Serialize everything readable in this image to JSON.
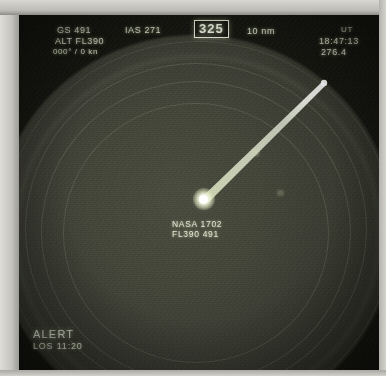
{
  "display": {
    "kind": "air-traffic-radar-scope",
    "colors": {
      "phosphor": "#d6dcc8",
      "screen_background": "#14150f",
      "disc": "#45473b",
      "highlight": "#ffffff",
      "bezel": "#c9c9c4"
    }
  },
  "header": {
    "ground_speed": "GS 491",
    "indicated_airspeed": "IAS 271",
    "heading_selected": "325",
    "range": "10 nm",
    "utc_label": "UT",
    "utc_time": "18:47:13",
    "baro": "276.4",
    "baro_unit": "mb"
  },
  "left_readout": {
    "altitude": "ALT FL390",
    "wind": "000° / 0 kn"
  },
  "target": {
    "callsign": "NASA 1702",
    "altitude_speed": "FL390  491",
    "symbol": "aircraft-blip",
    "trail": "velocity-leader-line"
  },
  "status": {
    "alert_label": "ALERT",
    "los_label": "LOS 11:20"
  },
  "rings": {
    "count": 4,
    "note": "concentric range rings"
  }
}
